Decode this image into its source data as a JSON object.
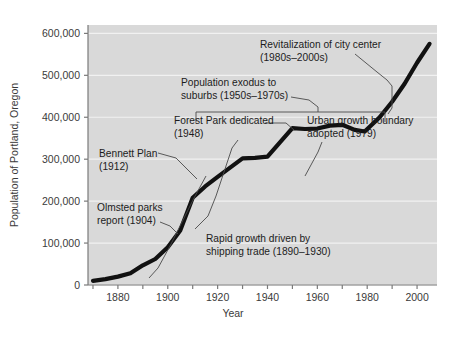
{
  "chart_data": {
    "type": "line",
    "title": "",
    "xlabel": "Year",
    "ylabel": "Population of Portland, Oregon",
    "xlim": [
      1868,
      2008
    ],
    "ylim": [
      0,
      620000
    ],
    "grid": true,
    "legend": "none",
    "x_ticks": [
      1870,
      1880,
      1890,
      1900,
      1910,
      1920,
      1930,
      1940,
      1950,
      1960,
      1970,
      1980,
      1990,
      2000
    ],
    "x_tick_labels": [
      "",
      "1880",
      "",
      "1900",
      "",
      "1920",
      "",
      "1940",
      "",
      "1960",
      "",
      "1980",
      "",
      "2000"
    ],
    "y_ticks": [
      0,
      100000,
      200000,
      300000,
      400000,
      500000,
      600000
    ],
    "y_tick_labels": [
      "0",
      "100,000",
      "200,000",
      "300,000",
      "400,000",
      "500,000",
      "600,000"
    ],
    "series": [
      {
        "name": "Population of Portland, Oregon",
        "color": "#111111",
        "x": [
          1870,
          1875,
          1880,
          1885,
          1890,
          1895,
          1900,
          1905,
          1910,
          1915,
          1920,
          1925,
          1930,
          1935,
          1940,
          1945,
          1950,
          1955,
          1960,
          1965,
          1970,
          1975,
          1979,
          1985,
          1990,
          1995,
          2000,
          2005
        ],
        "values": [
          10000,
          14000,
          20000,
          28000,
          47000,
          62000,
          90000,
          130000,
          208000,
          235000,
          258000,
          280000,
          302000,
          303000,
          306000,
          340000,
          374000,
          372000,
          373000,
          380000,
          382000,
          370000,
          366000,
          400000,
          437000,
          480000,
          530000,
          575000
        ]
      }
    ],
    "annotations": [
      {
        "id": "revitalization",
        "text_lines": [
          "Revitalization of city center",
          "(1980s–2000s)"
        ],
        "period": "1980s-2000s"
      },
      {
        "id": "population-exodus",
        "text_lines": [
          "Population exodus to",
          "suburbs (1950s–1970s)"
        ],
        "period": "1950s-1970s"
      },
      {
        "id": "forest-park",
        "text_lines": [
          "Forest Park dedicated",
          "(1948)"
        ],
        "year": 1948
      },
      {
        "id": "urban-growth-boundary",
        "text_lines": [
          "Urban growth boundary",
          "adopted (1979)"
        ],
        "year": 1979
      },
      {
        "id": "bennett-plan",
        "text_lines": [
          "Bennett Plan",
          "(1912)"
        ],
        "year": 1912
      },
      {
        "id": "olmsted-parks",
        "text_lines": [
          "Olmsted parks",
          "report (1904)"
        ],
        "year": 1904
      },
      {
        "id": "rapid-growth",
        "text_lines": [
          "Rapid growth driven by",
          "shipping trade (1890–1930)"
        ],
        "period": "1890-1930"
      }
    ],
    "colors": {
      "plot_background": "#d9d9d9",
      "grid": "#f0f0f0",
      "axis": "#7a7a7a",
      "line": "#111111",
      "text": "#1c1c1c",
      "tick_text": "#3a3a3a",
      "leader": "#555555",
      "page_background": "#ffffff"
    }
  }
}
